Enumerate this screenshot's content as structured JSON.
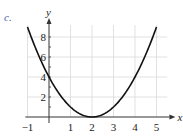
{
  "part_label": "c.",
  "chart_data": {
    "type": "line",
    "title": "",
    "function": "y = (x - 2)^2",
    "xlabel": "x",
    "ylabel": "y",
    "xlim": [
      -1,
      5
    ],
    "ylim": [
      0,
      9
    ],
    "x_ticks": [
      -1,
      1,
      2,
      3,
      4,
      5
    ],
    "y_ticks": [
      2,
      4,
      6,
      8
    ],
    "grid": true,
    "legend": null,
    "series": [
      {
        "name": "parabola",
        "x": [
          -1,
          0,
          1,
          2,
          3,
          4,
          5
        ],
        "y": [
          9,
          4,
          1,
          0,
          1,
          4,
          9
        ]
      }
    ]
  },
  "colors": {
    "curve": "#111111",
    "axis": "#333333",
    "grid": "#d9d9d9",
    "part_label": "#3b5ea8"
  }
}
